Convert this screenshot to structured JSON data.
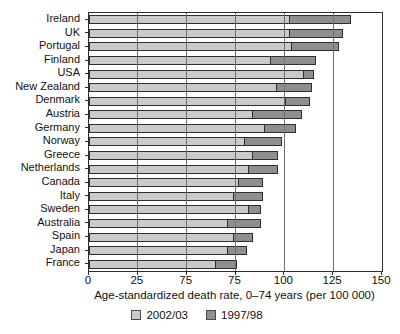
{
  "chart_data": {
    "type": "bar",
    "orientation": "horizontal",
    "title": "",
    "xlabel": "Age-standardized death rate, 0–74 years (per 100 000)",
    "ylabel": "",
    "xlim": [
      0,
      150
    ],
    "grid": true,
    "legend_position": "bottom",
    "x_tick_values": [
      0,
      25,
      50,
      75,
      100,
      125,
      150
    ],
    "x_tick_labels": [
      "0",
      "25",
      "75",
      "75",
      "100",
      "125",
      "150"
    ],
    "categories": [
      "Ireland",
      "UK",
      "Portugal",
      "Finland",
      "USA",
      "New Zealand",
      "Denmark",
      "Austria",
      "Germany",
      "Norway",
      "Greece",
      "Netherlands",
      "Canada",
      "Italy",
      "Sweden",
      "Australia",
      "Spain",
      "Japan",
      "France"
    ],
    "series": [
      {
        "name": "2002/03",
        "color": "#cacaca",
        "values": [
          103,
          103,
          104,
          93,
          110,
          96,
          101,
          84,
          90,
          80,
          84,
          82,
          77,
          74,
          82,
          71,
          74,
          71,
          65
        ]
      },
      {
        "name": "1997/98",
        "color": "#8f8f8f",
        "values": [
          134,
          130,
          128,
          116,
          115,
          114,
          113,
          109,
          106,
          99,
          97,
          97,
          89,
          89,
          88,
          88,
          84,
          81,
          76
        ]
      }
    ]
  },
  "colors": {
    "bar_border": "#2e2e2e",
    "gridline": "#6e6e6e",
    "frame": "#2e2e2e",
    "text": "#111111",
    "background": "#ffffff"
  }
}
